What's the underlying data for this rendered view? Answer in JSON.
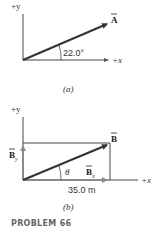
{
  "figure_a": {
    "y_axis_label": "+y",
    "x_axis_label": "+x",
    "vector_label": "A",
    "angle_label": "22.0°",
    "caption": "(a)"
  },
  "figure_b": {
    "y_axis_label": "+y",
    "x_axis_label": "+x",
    "vector_label": "B",
    "y_component_label": "B",
    "y_component_sub": "y",
    "x_component_label": "B",
    "x_component_sub": "x",
    "angle_label": "θ",
    "length_label": "35.0 m",
    "caption": "(b)"
  },
  "problem_label": "PROBLEM 66",
  "colors": {
    "axis": "#333333",
    "vector": "#333333",
    "component": "#8a8a8a"
  }
}
